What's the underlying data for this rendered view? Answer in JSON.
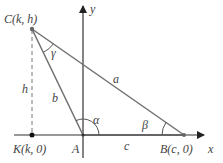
{
  "diagram": {
    "type": "triangle-on-coordinate-axes",
    "colors": {
      "axis": "#333333",
      "triangle": "#707070",
      "dashed": "#777777",
      "text": "#444444",
      "point": "#222222"
    },
    "axes": {
      "x_label": "x",
      "y_label": "y"
    },
    "points": {
      "C": {
        "name": "C",
        "coords": "(k, h)",
        "label": "C(k, h)"
      },
      "A": {
        "name": "A",
        "label": "A"
      },
      "B": {
        "name": "B",
        "coords": "(c, 0)",
        "label": "B(c, 0)"
      },
      "K": {
        "name": "K",
        "coords": "(k, 0)",
        "label": "K(k, 0)"
      }
    },
    "sides": {
      "a": "a",
      "b": "b",
      "c": "c",
      "h": "h"
    },
    "angles": {
      "alpha": "α",
      "beta": "β",
      "gamma": "γ"
    }
  }
}
